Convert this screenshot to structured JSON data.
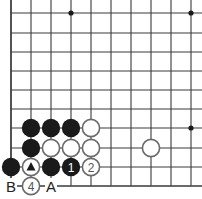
{
  "diagram": {
    "type": "go-board-diagram",
    "colors": {
      "line": "#3a3a3a",
      "black_stone": "#1a1a1a",
      "white_stone_fill": "#ffffff",
      "white_stone_stroke": "#6a6a6a",
      "label_text": "#222222"
    },
    "grid": {
      "columns_x": [
        11,
        31,
        51,
        71,
        91,
        111,
        131,
        151,
        171,
        191
      ],
      "rows_y": [
        13,
        33,
        52,
        71,
        90,
        109,
        128,
        148,
        167,
        186
      ],
      "left_edge": true,
      "bottom_edge": true
    },
    "star_points": [
      {
        "col": 3,
        "row": 0
      },
      {
        "col": 9,
        "row": 0
      },
      {
        "col": 9,
        "row": 6
      }
    ],
    "stones": [
      {
        "col": 1,
        "row": 6,
        "color": "black",
        "label": ""
      },
      {
        "col": 2,
        "row": 6,
        "color": "black",
        "label": ""
      },
      {
        "col": 3,
        "row": 6,
        "color": "black",
        "label": ""
      },
      {
        "col": 4,
        "row": 6,
        "color": "white",
        "label": ""
      },
      {
        "col": 1,
        "row": 7,
        "color": "black",
        "label": ""
      },
      {
        "col": 2,
        "row": 7,
        "color": "white",
        "label": ""
      },
      {
        "col": 3,
        "row": 7,
        "color": "white",
        "label": ""
      },
      {
        "col": 4,
        "row": 7,
        "color": "white",
        "label": ""
      },
      {
        "col": 7,
        "row": 7,
        "color": "white",
        "label": ""
      },
      {
        "col": 0,
        "row": 8,
        "color": "black",
        "label": ""
      },
      {
        "col": 1,
        "row": 8,
        "color": "white",
        "label": "",
        "marker": "triangle"
      },
      {
        "col": 2,
        "row": 8,
        "color": "black",
        "label": ""
      },
      {
        "col": 3,
        "row": 8,
        "color": "black",
        "label": "1"
      },
      {
        "col": 4,
        "row": 8,
        "color": "white",
        "label": "2"
      },
      {
        "col": 1,
        "row": 9,
        "color": "white",
        "label": "4"
      }
    ],
    "point_labels": [
      {
        "col": 0,
        "row": 9,
        "text": "B"
      },
      {
        "col": 2,
        "row": 9,
        "text": "A"
      }
    ]
  }
}
